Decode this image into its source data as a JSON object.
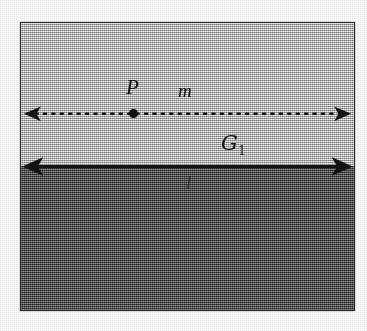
{
  "figure": {
    "kind": "geometry-diagram",
    "caption_text": "",
    "frame": {
      "border_color": "#2a2a2a"
    },
    "regions": [
      {
        "id": "upper",
        "name": "upper-half-plane",
        "shade": "light-gray",
        "color": "#c9c9c9"
      },
      {
        "id": "lower",
        "name": "lower-half-plane",
        "shade": "dark-gray",
        "color": "#575757"
      }
    ],
    "lines": [
      {
        "id": "m",
        "label": "m",
        "style": "dotted",
        "arrowheads": "both",
        "color": "#141414",
        "position_note": "inside light region"
      },
      {
        "id": "l",
        "label": "l",
        "style": "solid",
        "arrowheads": "both",
        "color": "#141414",
        "position_note": "on boundary between light and dark regions"
      }
    ],
    "points": [
      {
        "id": "P",
        "label": "P",
        "marker": "filled-dot",
        "color": "#101010",
        "on_line": "m"
      }
    ],
    "labels": {
      "point_P": "P",
      "line_m": "m",
      "region_G1": "G",
      "region_G1_subscript": "1",
      "line_l": "l"
    }
  }
}
